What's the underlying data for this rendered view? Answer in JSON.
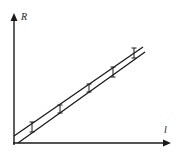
{
  "diagram": {
    "title": "",
    "y_axis_label": "R",
    "x_axis_label": "l",
    "colors": {
      "ink": "#1a1a1a",
      "background": "#ffffff"
    },
    "lines": [
      {
        "name": "max-gradient-line",
        "x1": 18,
        "y1": 143,
        "x2": 145,
        "y2": 52
      },
      {
        "name": "min-gradient-line",
        "x1": 14,
        "y1": 136,
        "x2": 143,
        "y2": 47
      }
    ],
    "points": [
      {
        "x": 32,
        "y": 127,
        "err": 5
      },
      {
        "x": 60,
        "y": 109,
        "err": 4
      },
      {
        "x": 89,
        "y": 88,
        "err": 4
      },
      {
        "x": 113,
        "y": 72,
        "err": 5
      },
      {
        "x": 134,
        "y": 53,
        "err": 5
      }
    ]
  }
}
